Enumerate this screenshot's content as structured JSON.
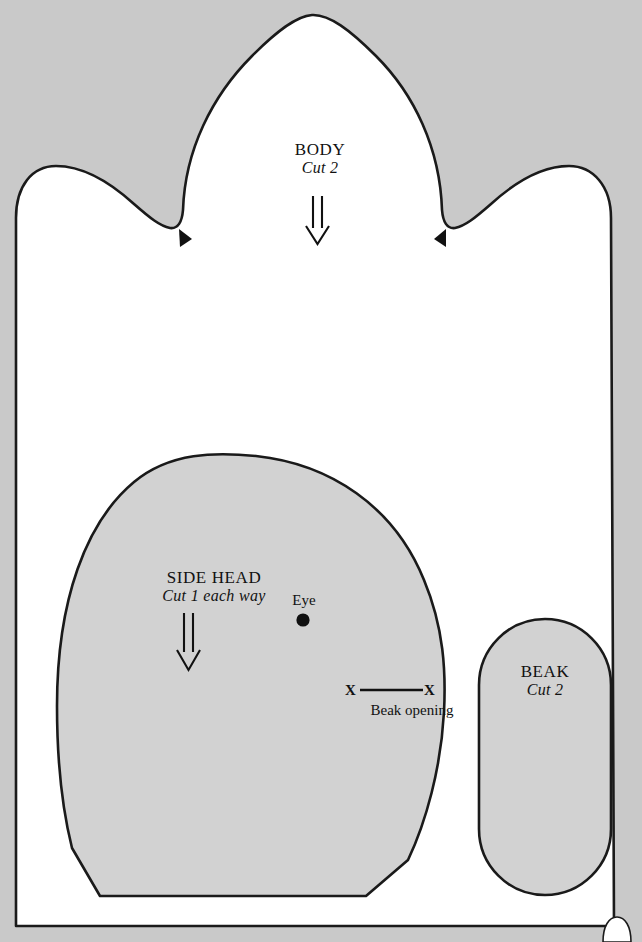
{
  "document": {
    "kind": "sewing-pattern-sheet",
    "background_color": "#c9c9c9",
    "sheet_color": "#ffffff",
    "piece_fill_color": "#d2d2d2",
    "outline_color": "#1a1a1a"
  },
  "pieces": {
    "body": {
      "name": "BODY",
      "cut": "Cut 2",
      "grain_arrow": "double-line-down-arrow",
      "notch_marks": 2
    },
    "side_head": {
      "name": "SIDE HEAD",
      "cut": "Cut 1 each way",
      "grain_arrow": "double-line-down-arrow",
      "eye_label": "Eye",
      "beak_opening_label": "Beak opening",
      "x_mark_left": "X",
      "x_mark_right": "X"
    },
    "beak": {
      "name": "BEAK",
      "cut": "Cut 2"
    }
  }
}
